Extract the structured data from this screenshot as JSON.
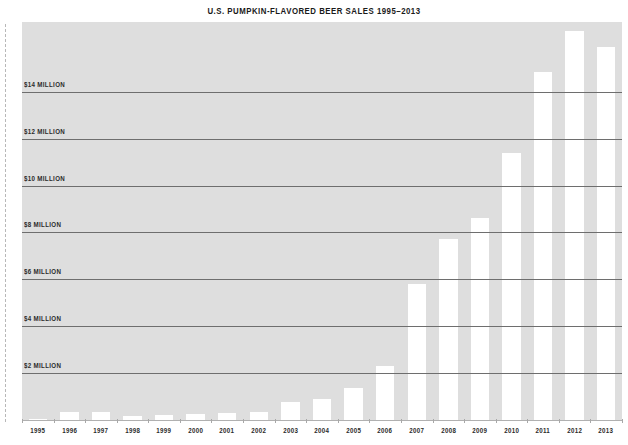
{
  "chart_data": {
    "type": "bar",
    "title": "U.S. PUMPKIN-FLAVORED BEER SALES 1995–2013",
    "xlabel": "",
    "ylabel": "",
    "categories": [
      "1995",
      "1996",
      "1997",
      "1998",
      "1999",
      "2000",
      "2001",
      "2002",
      "2003",
      "2004",
      "2005",
      "2006",
      "2007",
      "2008",
      "2009",
      "2010",
      "2011",
      "2012",
      "2013"
    ],
    "values": [
      0.05,
      0.35,
      0.35,
      0.15,
      0.2,
      0.25,
      0.3,
      0.35,
      0.75,
      0.9,
      1.35,
      2.3,
      5.8,
      7.7,
      8.6,
      11.4,
      14.85,
      16.6,
      15.9
    ],
    "ylim": [
      0,
      17
    ],
    "ytick_values": [
      2,
      4,
      6,
      8,
      10,
      12,
      14
    ],
    "ytick_labels": [
      "$2 MILLION",
      "$4 MILLION",
      "$6 MILLION",
      "$8 MILLION",
      "$10 MILLION",
      "$12 MILLION",
      "$14 MILLION"
    ],
    "grid": "horizontal",
    "legend": "none",
    "units": "US dollars (millions)",
    "colors": {
      "bar_fill": "#ffffff",
      "panel_background": "#dedede",
      "gridline": "#6e6e6e",
      "text": "#2b2b2b",
      "title": "#1a1a1a",
      "page_background": "#ffffff",
      "dashed_rule": "#b8b8b8"
    }
  },
  "figure": {
    "title": "U.S. PUMPKIN-FLAVORED BEER SALES 1995–2013"
  }
}
